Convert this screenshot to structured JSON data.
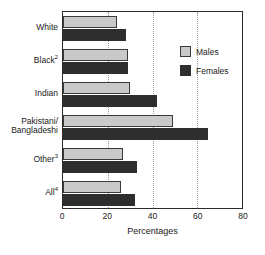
{
  "chart_data": {
    "type": "bar",
    "orientation": "horizontal",
    "title": "",
    "xlabel": "Percentages",
    "ylabel": "",
    "xlim": [
      0,
      80
    ],
    "xticks": [
      0,
      20,
      40,
      60,
      80
    ],
    "grid": "vertical-dotted",
    "categories": [
      "White",
      "Black2",
      "Indian",
      "Pakistani/ Bangladeshi",
      "Other3",
      "All4"
    ],
    "category_labels": [
      {
        "text": "White",
        "sup": ""
      },
      {
        "text": "Black",
        "sup": "2"
      },
      {
        "text": "Indian",
        "sup": ""
      },
      {
        "text": "Pakistani/",
        "text2": "Bangladeshi",
        "sup": ""
      },
      {
        "text": "Other",
        "sup": "3"
      },
      {
        "text": "All",
        "sup": "4"
      }
    ],
    "series": [
      {
        "name": "Males",
        "color": "#c9c9c9",
        "values": [
          24,
          29,
          30,
          49,
          27,
          26
        ]
      },
      {
        "name": "Females",
        "color": "#2e2e2e",
        "values": [
          28,
          29,
          42,
          65,
          33,
          32
        ]
      }
    ],
    "legend_position": "top-right"
  },
  "legend": {
    "entries": [
      {
        "label": "Males",
        "swatch": "males"
      },
      {
        "label": "Females",
        "swatch": "females"
      }
    ]
  },
  "axis": {
    "x_title": "Percentages",
    "x_tick_labels": [
      "0",
      "20",
      "40",
      "60",
      "80"
    ]
  },
  "colors": {
    "males": "#c9c9c9",
    "females": "#2e2e2e",
    "axis": "#2b2b2b",
    "grid": "#9a9a9a",
    "background": "#ffffff"
  }
}
